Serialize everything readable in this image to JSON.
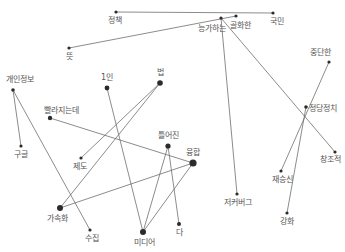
{
  "diagram": {
    "type": "word-network",
    "colors": {
      "edge": "#6f6f6f",
      "node": "#2b2b2b",
      "label": "#555555",
      "background": "#ffffff"
    },
    "nodes": [
      {
        "id": "jeongchaek",
        "label": "정책",
        "x": 116,
        "y": 12,
        "r": 1.6,
        "lx": 115,
        "ly": 23,
        "anchor": "middle"
      },
      {
        "id": "gukmin",
        "label": "국민",
        "x": 273,
        "y": 13,
        "r": 1.6,
        "lx": 277,
        "ly": 24,
        "anchor": "middle"
      },
      {
        "id": "neunggahaneun",
        "label": "능가하는",
        "x": 221,
        "y": 18,
        "r": 1.6,
        "lx": 212,
        "ly": 31,
        "anchor": "middle"
      },
      {
        "id": "golhwahan",
        "label": "골화한",
        "x": 236,
        "y": 16,
        "r": 1.6,
        "lx": 240,
        "ly": 28,
        "anchor": "middle"
      },
      {
        "id": "tteut",
        "label": "뜻",
        "x": 69,
        "y": 48,
        "r": 1.6,
        "lx": 69,
        "ly": 59,
        "anchor": "middle"
      },
      {
        "id": "gaeinjeongbo",
        "label": "개인정보",
        "x": 13,
        "y": 90,
        "r": 1.8,
        "lx": 20,
        "ly": 82,
        "anchor": "middle"
      },
      {
        "id": "ilin",
        "label": "1인",
        "x": 107,
        "y": 88,
        "r": 2.4,
        "lx": 107,
        "ly": 80,
        "anchor": "middle"
      },
      {
        "id": "beop",
        "label": "법",
        "x": 160,
        "y": 83,
        "r": 2.8,
        "lx": 160,
        "ly": 75,
        "anchor": "middle"
      },
      {
        "id": "ppallajineunde",
        "label": "빨라지는데",
        "x": 50,
        "y": 118,
        "r": 2.2,
        "lx": 61,
        "ly": 113,
        "anchor": "middle"
      },
      {
        "id": "gugeul",
        "label": "구글",
        "x": 21,
        "y": 146,
        "r": 1.6,
        "lx": 21,
        "ly": 157,
        "anchor": "middle"
      },
      {
        "id": "jedo",
        "label": "제도",
        "x": 81,
        "y": 158,
        "r": 1.6,
        "lx": 80,
        "ly": 169,
        "anchor": "middle"
      },
      {
        "id": "teureojin",
        "label": "틀어진",
        "x": 168,
        "y": 146,
        "r": 2.6,
        "lx": 168,
        "ly": 138,
        "anchor": "middle"
      },
      {
        "id": "yunghap",
        "label": "융합",
        "x": 193,
        "y": 163,
        "r": 3.6,
        "lx": 193,
        "ly": 155,
        "anchor": "middle"
      },
      {
        "id": "gasokhwa",
        "label": "가속화",
        "x": 60,
        "y": 208,
        "r": 3.0,
        "lx": 57,
        "ly": 221,
        "anchor": "middle"
      },
      {
        "id": "sujip",
        "label": "수집",
        "x": 90,
        "y": 230,
        "r": 1.6,
        "lx": 92,
        "ly": 241,
        "anchor": "middle"
      },
      {
        "id": "midieo",
        "label": "미디어",
        "x": 143,
        "y": 232,
        "r": 3.0,
        "lx": 144,
        "ly": 245,
        "anchor": "middle"
      },
      {
        "id": "da",
        "label": "다",
        "x": 179,
        "y": 224,
        "r": 2.0,
        "lx": 179,
        "ly": 235,
        "anchor": "middle"
      },
      {
        "id": "jeokeobeogeu",
        "label": "저커버그",
        "x": 237,
        "y": 194,
        "r": 1.6,
        "lx": 238,
        "ly": 205,
        "anchor": "middle"
      },
      {
        "id": "jungdanhan",
        "label": "중단한",
        "x": 329,
        "y": 62,
        "r": 1.6,
        "lx": 320,
        "ly": 55,
        "anchor": "middle"
      },
      {
        "id": "jeongdangjeongchi",
        "label": "정당정치",
        "x": 306,
        "y": 107,
        "r": 1.8,
        "lx": 309,
        "ly": 111,
        "anchor": "start"
      },
      {
        "id": "jaeseungsin",
        "label": "재승신",
        "x": 281,
        "y": 171,
        "r": 1.6,
        "lx": 282,
        "ly": 182,
        "anchor": "middle"
      },
      {
        "id": "changjojeok",
        "label": "창조적",
        "x": 335,
        "y": 152,
        "r": 1.6,
        "lx": 330,
        "ly": 162,
        "anchor": "middle"
      },
      {
        "id": "ganghwa",
        "label": "강화",
        "x": 287,
        "y": 213,
        "r": 1.6,
        "lx": 287,
        "ly": 224,
        "anchor": "middle"
      }
    ],
    "edges": [
      {
        "from": "jeongchaek",
        "to": "gukmin"
      },
      {
        "from": "tteut",
        "to": "golhwahan"
      },
      {
        "from": "neunggahaneun",
        "to": "jeokeobeogeu"
      },
      {
        "from": "neunggahaneun",
        "to": "changjojeok"
      },
      {
        "from": "jungdanhan",
        "to": "jaeseungsin"
      },
      {
        "from": "jeongdangjeongchi",
        "to": "ganghwa"
      },
      {
        "from": "gaeinjeongbo",
        "to": "gugeul"
      },
      {
        "from": "gaeinjeongbo",
        "to": "sujip"
      },
      {
        "from": "ilin",
        "to": "midieo"
      },
      {
        "from": "beop",
        "to": "jedo"
      },
      {
        "from": "beop",
        "to": "gasokhwa"
      },
      {
        "from": "ppallajineunde",
        "to": "yunghap"
      },
      {
        "from": "teureojin",
        "to": "midieo"
      },
      {
        "from": "teureojin",
        "to": "da"
      },
      {
        "from": "yunghap",
        "to": "midieo"
      },
      {
        "from": "yunghap",
        "to": "gasokhwa"
      }
    ]
  }
}
